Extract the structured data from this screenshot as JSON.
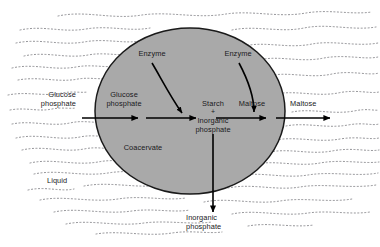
{
  "figure": {
    "type": "scientific-diagram",
    "background_color": "#ffffff",
    "droplet_fill_color": "#a9a9a9",
    "droplet_stroke_color": "#1a1a1a",
    "arrow_color": "#000000",
    "text_color": "#19191c",
    "medium_texture": "dotted-wavy-lines"
  },
  "labels": {
    "glucose_phosphate_outside": "Glucose\nphosphate",
    "glucose_phosphate_inside": "Glucose\nphosphate",
    "enzyme_left": "Enzyme",
    "enzyme_right": "Enzyme",
    "starch": "Starch",
    "plus": "+",
    "inorganic_phosphate_inside": "Inorganic\nphosphate",
    "maltose_inside": "Maltose",
    "maltose_outside": "Maltose",
    "coacervate": "Coacervate",
    "liquid": "Liquid",
    "inorganic_phosphate_outside": "Inorganic\nphosphate"
  },
  "geometry": {
    "droplet_center_x": 190,
    "droplet_center_y": 111,
    "droplet_radius_x": 95,
    "droplet_radius_y": 83
  }
}
